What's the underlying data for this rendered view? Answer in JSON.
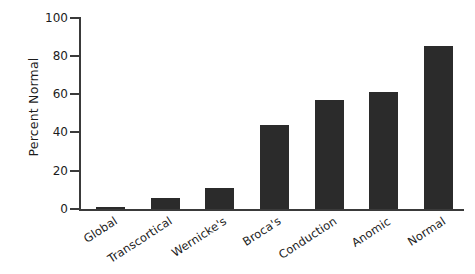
{
  "chart_data": {
    "type": "bar",
    "title": "",
    "xlabel": "",
    "ylabel": "Percent Normal",
    "ylim": [
      0,
      100
    ],
    "yticks": [
      0,
      20,
      40,
      60,
      80,
      100
    ],
    "grid": false,
    "legend": null,
    "bar_color": "#2b2b2b",
    "background_color": "#ffffff",
    "axis_color": "#3a3a3a",
    "categories": [
      "Global",
      "Transcortical",
      "Wernicke's",
      "Broca's",
      "Conduction",
      "Anomic",
      "Normal"
    ],
    "values": [
      1,
      6,
      11,
      44,
      57,
      61,
      85
    ],
    "xtick_label_rotation_deg": -33
  }
}
